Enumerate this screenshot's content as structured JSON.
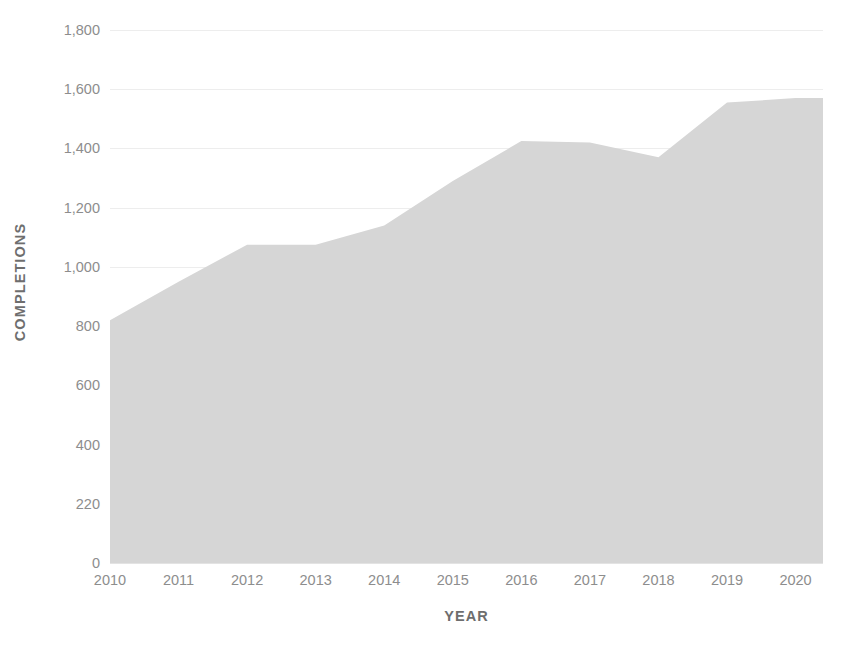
{
  "chart_data": {
    "type": "area",
    "title": "",
    "xlabel": "YEAR",
    "ylabel": "COMPLETIONS",
    "x": [
      2010,
      2011,
      2012,
      2013,
      2014,
      2015,
      2016,
      2017,
      2018,
      2019,
      2020
    ],
    "categories": [
      "2010",
      "2011",
      "2012",
      "2013",
      "2014",
      "2015",
      "2016",
      "2017",
      "2018",
      "2019",
      "2020"
    ],
    "values": [
      820,
      950,
      1075,
      1075,
      1140,
      1290,
      1425,
      1420,
      1370,
      1555,
      1570
    ],
    "series": [
      {
        "name": "Completions",
        "values": [
          820,
          950,
          1075,
          1075,
          1140,
          1290,
          1425,
          1420,
          1370,
          1555,
          1570
        ]
      }
    ],
    "xlim": [
      2010,
      2020.4
    ],
    "ylim": [
      0,
      1800
    ],
    "ytick_values": [
      0,
      200,
      400,
      600,
      800,
      1000,
      1200,
      1400,
      1600,
      1800
    ],
    "ytick_labels": [
      "0",
      "220",
      "400",
      "600",
      "800",
      "1,000",
      "1,200",
      "1,400",
      "1,600",
      "1,800"
    ],
    "xtick_labels": [
      "2010",
      "2011",
      "2012",
      "2013",
      "2014",
      "2015",
      "2016",
      "2017",
      "2018",
      "2019",
      "2020"
    ],
    "grid": true,
    "grid_axis": "y",
    "legend": false,
    "legend_position": "none",
    "colors": {
      "area_fill": "#d6d6d6",
      "gridline": "#ededed",
      "tick_label": "#8d8d8d",
      "axis_title": "#6e6e6e",
      "background": "#ffffff"
    }
  }
}
